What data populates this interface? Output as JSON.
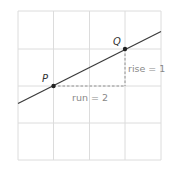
{
  "diagram": {
    "grid": {
      "cols": 4,
      "rows": 4,
      "color": "#dcdcdc"
    },
    "line": {
      "color": "#3a3a3a",
      "slope": "1/2"
    },
    "points": [
      {
        "label": "P",
        "grid_x": 1,
        "grid_y": 2
      },
      {
        "label": "Q",
        "grid_x": 3,
        "grid_y": 1
      }
    ],
    "annotations": {
      "rise": "rise = 1",
      "run": "run = 2"
    }
  }
}
